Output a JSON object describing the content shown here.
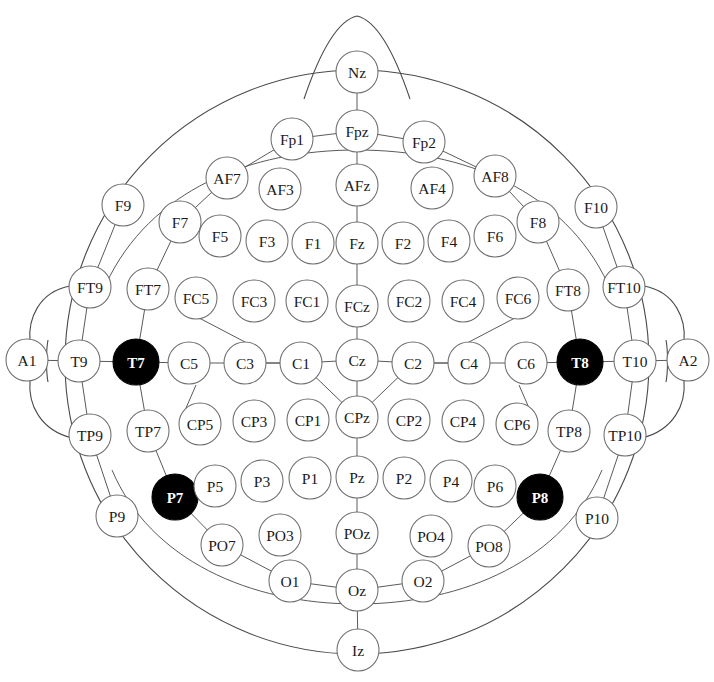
{
  "diagram": {
    "colors": {
      "background": "#ffffff",
      "outline": "#4a4a4a",
      "node_stroke": "#6d6d6d",
      "node_fill": "#ffffff",
      "highlight_fill": "#000000",
      "highlight_text": "#ffffff",
      "label_text": "#1a1a1a",
      "link": "#5a5a5a"
    },
    "highlighted_electrodes": [
      "T7",
      "T8",
      "P7",
      "P8"
    ],
    "electrode_count": 89
  },
  "electrodes": [
    {
      "id": "Nz",
      "label": "Nz",
      "x": 357,
      "y": 72,
      "r": 21,
      "highlighted": false
    },
    {
      "id": "Fp1",
      "label": "Fp1",
      "x": 292,
      "y": 139,
      "r": 21,
      "highlighted": false
    },
    {
      "id": "Fpz",
      "label": "Fpz",
      "x": 357,
      "y": 131,
      "r": 21,
      "highlighted": false
    },
    {
      "id": "Fp2",
      "label": "Fp2",
      "x": 424,
      "y": 142,
      "r": 21,
      "highlighted": false
    },
    {
      "id": "AF7",
      "label": "AF7",
      "x": 227,
      "y": 178,
      "r": 21,
      "highlighted": false
    },
    {
      "id": "AF3",
      "label": "AF3",
      "x": 280,
      "y": 189,
      "r": 21,
      "highlighted": false
    },
    {
      "id": "AFz",
      "label": "AFz",
      "x": 357,
      "y": 185,
      "r": 21,
      "highlighted": false
    },
    {
      "id": "AF4",
      "label": "AF4",
      "x": 432,
      "y": 188,
      "r": 21,
      "highlighted": false
    },
    {
      "id": "AF8",
      "label": "AF8",
      "x": 495,
      "y": 176,
      "r": 21,
      "highlighted": false
    },
    {
      "id": "F9",
      "label": "F9",
      "x": 123,
      "y": 205,
      "r": 21,
      "highlighted": false
    },
    {
      "id": "F7",
      "label": "F7",
      "x": 180,
      "y": 222,
      "r": 21,
      "highlighted": false
    },
    {
      "id": "F5",
      "label": "F5",
      "x": 220,
      "y": 236,
      "r": 21,
      "highlighted": false
    },
    {
      "id": "F3",
      "label": "F3",
      "x": 267,
      "y": 241,
      "r": 21,
      "highlighted": false
    },
    {
      "id": "F1",
      "label": "F1",
      "x": 313,
      "y": 243,
      "r": 21,
      "highlighted": false
    },
    {
      "id": "Fz",
      "label": "Fz",
      "x": 357,
      "y": 243,
      "r": 21,
      "highlighted": false
    },
    {
      "id": "F2",
      "label": "F2",
      "x": 403,
      "y": 243,
      "r": 21,
      "highlighted": false
    },
    {
      "id": "F4",
      "label": "F4",
      "x": 449,
      "y": 241,
      "r": 21,
      "highlighted": false
    },
    {
      "id": "F6",
      "label": "F6",
      "x": 495,
      "y": 236,
      "r": 21,
      "highlighted": false
    },
    {
      "id": "F8",
      "label": "F8",
      "x": 538,
      "y": 222,
      "r": 21,
      "highlighted": false
    },
    {
      "id": "F10",
      "label": "F10",
      "x": 596,
      "y": 207,
      "r": 21,
      "highlighted": false
    },
    {
      "id": "FT9",
      "label": "FT9",
      "x": 90,
      "y": 287,
      "r": 21,
      "highlighted": false
    },
    {
      "id": "FT7",
      "label": "FT7",
      "x": 148,
      "y": 289,
      "r": 21,
      "highlighted": false
    },
    {
      "id": "FC5",
      "label": "FC5",
      "x": 196,
      "y": 298,
      "r": 21,
      "highlighted": false
    },
    {
      "id": "FC3",
      "label": "FC3",
      "x": 254,
      "y": 301,
      "r": 21,
      "highlighted": false
    },
    {
      "id": "FC1",
      "label": "FC1",
      "x": 307,
      "y": 301,
      "r": 21,
      "highlighted": false
    },
    {
      "id": "FCz",
      "label": "FCz",
      "x": 357,
      "y": 306,
      "r": 21,
      "highlighted": false
    },
    {
      "id": "FC2",
      "label": "FC2",
      "x": 409,
      "y": 301,
      "r": 21,
      "highlighted": false
    },
    {
      "id": "FC4",
      "label": "FC4",
      "x": 463,
      "y": 301,
      "r": 21,
      "highlighted": false
    },
    {
      "id": "FC6",
      "label": "FC6",
      "x": 518,
      "y": 298,
      "r": 21,
      "highlighted": false
    },
    {
      "id": "FT8",
      "label": "FT8",
      "x": 568,
      "y": 290,
      "r": 21,
      "highlighted": false
    },
    {
      "id": "FT10",
      "label": "FT10",
      "x": 624,
      "y": 287,
      "r": 21,
      "highlighted": false
    },
    {
      "id": "A1",
      "label": "A1",
      "x": 27,
      "y": 360,
      "r": 21,
      "highlighted": false
    },
    {
      "id": "T9",
      "label": "T9",
      "x": 79,
      "y": 361,
      "r": 21,
      "highlighted": false
    },
    {
      "id": "T7",
      "label": "T7",
      "x": 136,
      "y": 362,
      "r": 23,
      "highlighted": true
    },
    {
      "id": "C5",
      "label": "C5",
      "x": 189,
      "y": 363,
      "r": 21,
      "highlighted": false
    },
    {
      "id": "C3",
      "label": "C3",
      "x": 245,
      "y": 363,
      "r": 21,
      "highlighted": false
    },
    {
      "id": "C1",
      "label": "C1",
      "x": 301,
      "y": 363,
      "r": 21,
      "highlighted": false
    },
    {
      "id": "Cz",
      "label": "Cz",
      "x": 357,
      "y": 360,
      "r": 21,
      "highlighted": false
    },
    {
      "id": "C2",
      "label": "C2",
      "x": 413,
      "y": 363,
      "r": 21,
      "highlighted": false
    },
    {
      "id": "C4",
      "label": "C4",
      "x": 469,
      "y": 363,
      "r": 21,
      "highlighted": false
    },
    {
      "id": "C6",
      "label": "C6",
      "x": 526,
      "y": 363,
      "r": 21,
      "highlighted": false
    },
    {
      "id": "T8",
      "label": "T8",
      "x": 580,
      "y": 362,
      "r": 23,
      "highlighted": true
    },
    {
      "id": "T10",
      "label": "T10",
      "x": 635,
      "y": 361,
      "r": 21,
      "highlighted": false
    },
    {
      "id": "A2",
      "label": "A2",
      "x": 688,
      "y": 360,
      "r": 21,
      "highlighted": false
    },
    {
      "id": "TP9",
      "label": "TP9",
      "x": 90,
      "y": 435,
      "r": 21,
      "highlighted": false
    },
    {
      "id": "TP7",
      "label": "TP7",
      "x": 148,
      "y": 431,
      "r": 21,
      "highlighted": false
    },
    {
      "id": "CP5",
      "label": "CP5",
      "x": 200,
      "y": 424,
      "r": 21,
      "highlighted": false
    },
    {
      "id": "CP3",
      "label": "CP3",
      "x": 254,
      "y": 421,
      "r": 21,
      "highlighted": false
    },
    {
      "id": "CP1",
      "label": "CP1",
      "x": 308,
      "y": 420,
      "r": 21,
      "highlighted": false
    },
    {
      "id": "CPz",
      "label": "CPz",
      "x": 357,
      "y": 417,
      "r": 21,
      "highlighted": false
    },
    {
      "id": "CP2",
      "label": "CP2",
      "x": 409,
      "y": 420,
      "r": 21,
      "highlighted": false
    },
    {
      "id": "CP4",
      "label": "CP4",
      "x": 463,
      "y": 421,
      "r": 21,
      "highlighted": false
    },
    {
      "id": "CP6",
      "label": "CP6",
      "x": 517,
      "y": 424,
      "r": 21,
      "highlighted": false
    },
    {
      "id": "TP8",
      "label": "TP8",
      "x": 569,
      "y": 431,
      "r": 21,
      "highlighted": false
    },
    {
      "id": "TP10",
      "label": "TP10",
      "x": 625,
      "y": 435,
      "r": 21,
      "highlighted": false
    },
    {
      "id": "P9",
      "label": "P9",
      "x": 117,
      "y": 516,
      "r": 21,
      "highlighted": false
    },
    {
      "id": "P7",
      "label": "P7",
      "x": 175,
      "y": 497,
      "r": 23,
      "highlighted": true
    },
    {
      "id": "P5",
      "label": "P5",
      "x": 215,
      "y": 486,
      "r": 21,
      "highlighted": false
    },
    {
      "id": "P3",
      "label": "P3",
      "x": 262,
      "y": 481,
      "r": 21,
      "highlighted": false
    },
    {
      "id": "P1",
      "label": "P1",
      "x": 310,
      "y": 478,
      "r": 21,
      "highlighted": false
    },
    {
      "id": "Pz",
      "label": "Pz",
      "x": 357,
      "y": 477,
      "r": 21,
      "highlighted": false
    },
    {
      "id": "P2",
      "label": "P2",
      "x": 404,
      "y": 478,
      "r": 21,
      "highlighted": false
    },
    {
      "id": "P4",
      "label": "P4",
      "x": 451,
      "y": 481,
      "r": 21,
      "highlighted": false
    },
    {
      "id": "P6",
      "label": "P6",
      "x": 495,
      "y": 486,
      "r": 21,
      "highlighted": false
    },
    {
      "id": "P8",
      "label": "P8",
      "x": 540,
      "y": 497,
      "r": 23,
      "highlighted": true
    },
    {
      "id": "P10",
      "label": "P10",
      "x": 597,
      "y": 518,
      "r": 21,
      "highlighted": false
    },
    {
      "id": "PO7",
      "label": "PO7",
      "x": 222,
      "y": 545,
      "r": 21,
      "highlighted": false
    },
    {
      "id": "PO3",
      "label": "PO3",
      "x": 280,
      "y": 535,
      "r": 21,
      "highlighted": false
    },
    {
      "id": "POz",
      "label": "POz",
      "x": 357,
      "y": 533,
      "r": 21,
      "highlighted": false
    },
    {
      "id": "PO4",
      "label": "PO4",
      "x": 431,
      "y": 536,
      "r": 21,
      "highlighted": false
    },
    {
      "id": "PO8",
      "label": "PO8",
      "x": 489,
      "y": 546,
      "r": 21,
      "highlighted": false
    },
    {
      "id": "O1",
      "label": "O1",
      "x": 290,
      "y": 581,
      "r": 21,
      "highlighted": false
    },
    {
      "id": "Oz",
      "label": "Oz",
      "x": 357,
      "y": 590,
      "r": 21,
      "highlighted": false
    },
    {
      "id": "O2",
      "label": "O2",
      "x": 423,
      "y": 581,
      "r": 21,
      "highlighted": false
    },
    {
      "id": "Iz",
      "label": "Iz",
      "x": 358,
      "y": 650,
      "r": 21,
      "highlighted": false
    }
  ],
  "links": [
    [
      "Nz",
      "Fpz"
    ],
    [
      "Fp1",
      "Fpz"
    ],
    [
      "Fpz",
      "Fp2"
    ],
    [
      "Fp1",
      "AF7"
    ],
    [
      "Fp2",
      "AF8"
    ],
    [
      "Fpz",
      "AFz"
    ],
    [
      "AF7",
      "F7"
    ],
    [
      "AF8",
      "F8"
    ],
    [
      "AFz",
      "Fz"
    ],
    [
      "F9",
      "FT9"
    ],
    [
      "F10",
      "FT10"
    ],
    [
      "F7",
      "FT7"
    ],
    [
      "F8",
      "FT8"
    ],
    [
      "Fz",
      "FCz"
    ],
    [
      "FCz",
      "Cz"
    ],
    [
      "FT9",
      "T9"
    ],
    [
      "FT7",
      "T7"
    ],
    [
      "FT8",
      "T8"
    ],
    [
      "FT10",
      "T10"
    ],
    [
      "A1",
      "T9"
    ],
    [
      "T9",
      "T7"
    ],
    [
      "T7",
      "C5"
    ],
    [
      "C5",
      "C3"
    ],
    [
      "C3",
      "C1"
    ],
    [
      "C1",
      "Cz"
    ],
    [
      "Cz",
      "C2"
    ],
    [
      "C2",
      "C4"
    ],
    [
      "C4",
      "C6"
    ],
    [
      "C6",
      "T8"
    ],
    [
      "T8",
      "T10"
    ],
    [
      "T10",
      "A2"
    ],
    [
      "T9",
      "TP9"
    ],
    [
      "T7",
      "TP7"
    ],
    [
      "T8",
      "TP8"
    ],
    [
      "T10",
      "TP10"
    ],
    [
      "Cz",
      "CPz"
    ],
    [
      "CPz",
      "Pz"
    ],
    [
      "C1",
      "CPz"
    ],
    [
      "CPz",
      "C2"
    ],
    [
      "C3",
      "C1"
    ],
    [
      "C2",
      "C4"
    ],
    [
      "TP9",
      "P9"
    ],
    [
      "TP7",
      "P7"
    ],
    [
      "TP8",
      "P8"
    ],
    [
      "TP10",
      "P10"
    ],
    [
      "P7",
      "PO7"
    ],
    [
      "P8",
      "PO8"
    ],
    [
      "Pz",
      "POz"
    ],
    [
      "POz",
      "Oz"
    ],
    [
      "PO7",
      "O1"
    ],
    [
      "PO8",
      "O2"
    ],
    [
      "O1",
      "Oz"
    ],
    [
      "Oz",
      "O2"
    ],
    [
      "Oz",
      "Iz"
    ]
  ],
  "head": {
    "center_x": 357,
    "center_y": 362,
    "radius_x": 292,
    "radius_y": 292,
    "nose_apex_y": 16,
    "nose_half_width": 53
  }
}
